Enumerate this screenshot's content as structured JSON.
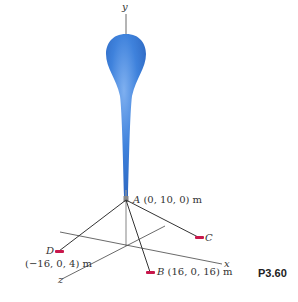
{
  "figure": {
    "problem_number": "P3.60",
    "axes": {
      "x": "x",
      "y": "y",
      "z": "z"
    },
    "points": {
      "A": {
        "letter": "A",
        "coords": "(0, 10, 0) m"
      },
      "B": {
        "letter": "B",
        "coords": "(16, 0, 16) m"
      },
      "C": {
        "letter": "C"
      },
      "D": {
        "letter": "D",
        "coords": "(−16, 0, 4) m"
      }
    },
    "colors": {
      "balloon": "#3b7fd9",
      "anchor": "#c8174b",
      "cable": "#333333",
      "axis": "#444444"
    }
  }
}
